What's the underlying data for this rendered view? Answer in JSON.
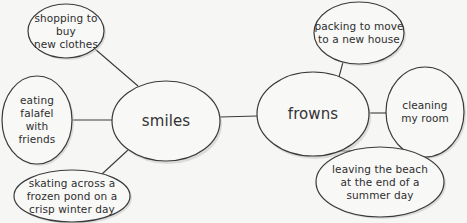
{
  "diagram": {
    "type": "web / concept map",
    "hubs": {
      "smiles": {
        "label": "smiles",
        "shape": {
          "cx": 166,
          "cy": 121,
          "rx": 54,
          "ry": 40
        }
      },
      "frowns": {
        "label": "frowns",
        "shape": {
          "cx": 313,
          "cy": 114,
          "rx": 56,
          "ry": 42
        }
      }
    },
    "nodes": {
      "shopping": {
        "hub": "smiles",
        "lines": [
          "shopping to buy",
          "new clothes"
        ],
        "shape": {
          "cx": 66,
          "cy": 31,
          "rx": 38,
          "ry": 27
        }
      },
      "falafel": {
        "hub": "smiles",
        "lines": [
          "eating",
          "falafel",
          "with",
          "friends"
        ],
        "shape": {
          "cx": 37,
          "cy": 120,
          "rx": 35,
          "ry": 44
        }
      },
      "skating": {
        "hub": "smiles",
        "lines": [
          "skating across a",
          "frozen pond on a",
          "crisp winter day"
        ],
        "shape": {
          "cx": 72,
          "cy": 196,
          "rx": 58,
          "ry": 26
        }
      },
      "packing": {
        "hub": "frowns",
        "lines": [
          "packing to move",
          "to a new house"
        ],
        "shape": {
          "cx": 359,
          "cy": 33,
          "rx": 45,
          "ry": 31
        }
      },
      "cleaning": {
        "hub": "frowns",
        "lines": [
          "cleaning",
          "my room"
        ],
        "shape": {
          "cx": 425,
          "cy": 112,
          "rx": 39,
          "ry": 45
        }
      },
      "leaving": {
        "hub": "frowns",
        "lines": [
          "leaving the beach",
          "at the end of a",
          "summer day"
        ],
        "shape": {
          "cx": 380,
          "cy": 182,
          "rx": 64,
          "ry": 35
        }
      }
    },
    "connections": [
      {
        "from": "smiles",
        "to": "frowns"
      },
      {
        "from": "smiles",
        "to": "shopping"
      },
      {
        "from": "smiles",
        "to": "falafel"
      },
      {
        "from": "smiles",
        "to": "skating"
      },
      {
        "from": "frowns",
        "to": "packing"
      },
      {
        "from": "frowns",
        "to": "cleaning"
      },
      {
        "from": "frowns",
        "to": "leaving"
      }
    ],
    "colors": {
      "background": "#f6f6f5",
      "stroke": "#3a3a3a",
      "fill": "#f8f8f7",
      "text": "#2e2e2e"
    }
  }
}
